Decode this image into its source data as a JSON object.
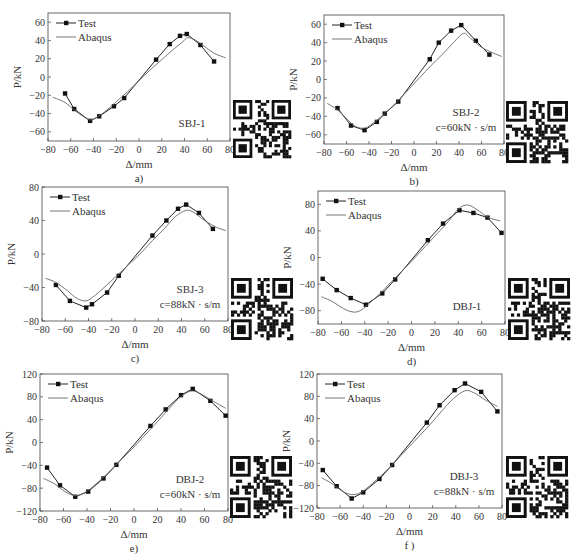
{
  "chart_data": [
    {
      "id": "a",
      "type": "line",
      "panel_label": "a)",
      "specimen": "SBJ-1",
      "damping": "",
      "xlabel": "Δ/mm",
      "ylabel": "P/kN",
      "xlim": [
        -80,
        80
      ],
      "ylim": [
        -70,
        70
      ],
      "xticks": [
        -80,
        -60,
        -40,
        -20,
        0,
        20,
        40,
        60,
        80
      ],
      "yticks": [
        -60,
        -40,
        -20,
        0,
        20,
        40,
        60
      ],
      "legend": [
        "Test",
        "Abaqus"
      ],
      "legend_position": "upper left",
      "grid": false,
      "frame": {
        "left": 48,
        "top": 13,
        "right": 230,
        "bottom": 141
      },
      "qr": {
        "x": 233,
        "y": 100,
        "size": 58
      },
      "series": [
        {
          "name": "Test",
          "marker": "square",
          "x": [
            -65,
            -57,
            -43,
            -35,
            -22,
            -13,
            15,
            27,
            36,
            42,
            54,
            66
          ],
          "y": [
            -18,
            -35,
            -48,
            -43,
            -32,
            -23,
            19,
            36,
            45,
            47,
            35,
            17
          ]
        },
        {
          "name": "Abaqus",
          "marker": "none",
          "x": [
            -76,
            -65,
            -55,
            -45,
            -40,
            -30,
            -20,
            -10,
            0,
            10,
            20,
            30,
            38,
            43,
            50,
            58,
            66,
            76
          ],
          "y": [
            -22,
            -28,
            -38,
            -46,
            -46,
            -38,
            -27,
            -16,
            -4,
            8,
            19,
            30,
            38,
            43,
            40,
            33,
            26,
            21
          ]
        }
      ]
    },
    {
      "id": "b",
      "type": "line",
      "panel_label": "b)",
      "specimen": "SBJ-2",
      "damping": "c=60kN · s/m",
      "xlabel": "Δ/mm",
      "ylabel": "P/kN",
      "xlim": [
        -80,
        80
      ],
      "ylim": [
        -70,
        70
      ],
      "xticks": [
        -80,
        -60,
        -40,
        -20,
        0,
        20,
        40,
        60,
        80
      ],
      "yticks": [
        -60,
        -40,
        -20,
        0,
        20,
        40,
        60
      ],
      "legend": [
        "Test",
        "Abaqus"
      ],
      "legend_position": "upper left",
      "grid": false,
      "frame": {
        "left": 324,
        "top": 15,
        "right": 504,
        "bottom": 144
      },
      "qr": {
        "x": 506,
        "y": 101,
        "size": 62
      },
      "series": [
        {
          "name": "Test",
          "marker": "square",
          "x": [
            -68,
            -56,
            -44,
            -33,
            -26,
            -14,
            14,
            22,
            33,
            42,
            55,
            67
          ],
          "y": [
            -31,
            -50,
            -55,
            -46,
            -37,
            -24,
            22,
            40,
            53,
            59,
            42,
            27
          ]
        },
        {
          "name": "Abaqus",
          "marker": "none",
          "x": [
            -77,
            -68,
            -58,
            -50,
            -42,
            -34,
            -25,
            -15,
            -5,
            5,
            15,
            25,
            35,
            44,
            50,
            60,
            70,
            78
          ],
          "y": [
            -26,
            -33,
            -45,
            -52,
            -52,
            -45,
            -36,
            -24,
            -11,
            2,
            15,
            27,
            40,
            50,
            45,
            35,
            29,
            25
          ]
        }
      ]
    },
    {
      "id": "c",
      "type": "line",
      "panel_label": "c)",
      "specimen": "SBJ-3",
      "damping": "c=88kN · s/m",
      "xlabel": "Δ/mm",
      "ylabel": "P/kN",
      "xlim": [
        -80,
        80
      ],
      "ylim": [
        -80,
        80
      ],
      "xticks": [
        -80,
        -60,
        -40,
        -20,
        0,
        20,
        40,
        60,
        80
      ],
      "yticks": [
        -80,
        -40,
        0,
        40,
        80
      ],
      "legend": [
        "Test",
        "Abaqus"
      ],
      "legend_position": "upper left",
      "grid": false,
      "frame": {
        "left": 42,
        "top": 187,
        "right": 228,
        "bottom": 321
      },
      "qr": {
        "x": 231,
        "y": 278,
        "size": 62
      },
      "series": [
        {
          "name": "Test",
          "marker": "square",
          "x": [
            -68,
            -56,
            -42,
            -37,
            -24,
            -14,
            15,
            27,
            37,
            44,
            55,
            67
          ],
          "y": [
            -37,
            -56,
            -64,
            -60,
            -46,
            -26,
            22,
            40,
            54,
            59,
            49,
            30
          ]
        },
        {
          "name": "Abaqus",
          "marker": "none",
          "x": [
            -77,
            -68,
            -58,
            -50,
            -42,
            -35,
            -25,
            -15,
            -5,
            5,
            15,
            25,
            35,
            44,
            50,
            60,
            70,
            78
          ],
          "y": [
            -29,
            -34,
            -44,
            -53,
            -56,
            -50,
            -38,
            -25,
            -12,
            1,
            16,
            30,
            45,
            52,
            50,
            40,
            32,
            28
          ]
        }
      ]
    },
    {
      "id": "d",
      "type": "line",
      "panel_label": "d)",
      "specimen": "DBJ-1",
      "damping": "",
      "xlabel": "Δ/mm",
      "ylabel": "P/kN",
      "xlim": [
        -80,
        80
      ],
      "ylim": [
        -100,
        100
      ],
      "xticks": [
        -80,
        -60,
        -40,
        -20,
        0,
        20,
        40,
        60,
        80
      ],
      "yticks": [
        -80,
        -40,
        0,
        40,
        80
      ],
      "legend": [
        "Test",
        "Abaqus"
      ],
      "legend_position": "upper left",
      "grid": false,
      "frame": {
        "left": 318,
        "top": 191,
        "right": 505,
        "bottom": 324
      },
      "qr": {
        "x": 508,
        "y": 278,
        "size": 62
      },
      "series": [
        {
          "name": "Test",
          "marker": "square",
          "x": [
            -76,
            -64,
            -52,
            -39,
            -25,
            -14,
            14,
            27,
            41,
            53,
            65,
            77
          ],
          "y": [
            -32,
            -49,
            -61,
            -71,
            -54,
            -33,
            26,
            51,
            71,
            67,
            60,
            37
          ]
        },
        {
          "name": "Abaqus",
          "marker": "none",
          "x": [
            -77,
            -68,
            -58,
            -50,
            -44,
            -38,
            -28,
            -18,
            -8,
            2,
            12,
            22,
            32,
            40,
            48,
            56,
            66,
            76
          ],
          "y": [
            -59,
            -66,
            -77,
            -82,
            -80,
            -72,
            -56,
            -38,
            -20,
            -2,
            17,
            36,
            55,
            73,
            79,
            72,
            60,
            55
          ]
        }
      ]
    },
    {
      "id": "e",
      "type": "line",
      "panel_label": "e)",
      "specimen": "DBJ-2",
      "damping": "c=60kN · s/m",
      "xlabel": "Δ/mm",
      "ylabel": "P/kN",
      "xlim": [
        -80,
        80
      ],
      "ylim": [
        -120,
        120
      ],
      "xticks": [
        -80,
        -60,
        -40,
        -20,
        0,
        20,
        40,
        60,
        80
      ],
      "yticks": [
        -120,
        -80,
        -40,
        0,
        40,
        80,
        120
      ],
      "legend": [
        "Test",
        "Abaqus"
      ],
      "legend_position": "upper left",
      "grid": false,
      "frame": {
        "left": 40,
        "top": 374,
        "right": 228,
        "bottom": 511
      },
      "qr": {
        "x": 230,
        "y": 456,
        "size": 62
      },
      "series": [
        {
          "name": "Test",
          "marker": "square",
          "x": [
            -74,
            -63,
            -50,
            -39,
            -26,
            -15,
            14,
            27,
            40,
            50,
            65,
            78
          ],
          "y": [
            -44,
            -75,
            -95,
            -86,
            -63,
            -39,
            29,
            58,
            83,
            94,
            73,
            47
          ]
        },
        {
          "name": "Abaqus",
          "marker": "none",
          "x": [
            -77,
            -68,
            -58,
            -50,
            -42,
            -32,
            -22,
            -12,
            -2,
            8,
            18,
            28,
            38,
            48,
            56,
            66,
            78
          ],
          "y": [
            -63,
            -72,
            -87,
            -93,
            -88,
            -72,
            -53,
            -32,
            -12,
            10,
            32,
            55,
            77,
            90,
            86,
            74,
            60
          ]
        }
      ]
    },
    {
      "id": "f",
      "type": "line",
      "panel_label": "f )",
      "specimen": "DBJ-3",
      "damping": "c=88kN · s/m",
      "xlabel": "Δ/mm",
      "ylabel": "P/kN",
      "xlim": [
        -80,
        80
      ],
      "ylim": [
        -120,
        120
      ],
      "xticks": [
        -80,
        -60,
        -40,
        -20,
        0,
        20,
        40,
        60,
        80
      ],
      "yticks": [
        -120,
        -80,
        -40,
        0,
        40,
        80,
        120
      ],
      "legend": [
        "Test",
        "Abaqus"
      ],
      "legend_position": "upper left",
      "grid": false,
      "frame": {
        "left": 317,
        "top": 374,
        "right": 502,
        "bottom": 508
      },
      "qr": {
        "x": 506,
        "y": 456,
        "size": 62
      },
      "series": [
        {
          "name": "Test",
          "marker": "square",
          "x": [
            -75,
            -63,
            -50,
            -40,
            -26,
            -15,
            15,
            26,
            39,
            48,
            62,
            76
          ],
          "y": [
            -52,
            -81,
            -103,
            -92,
            -68,
            -43,
            33,
            64,
            91,
            103,
            88,
            53
          ]
        },
        {
          "name": "Abaqus",
          "marker": "none",
          "x": [
            -76,
            -68,
            -58,
            -50,
            -42,
            -32,
            -22,
            -12,
            -2,
            8,
            18,
            28,
            38,
            48,
            56,
            66,
            76
          ],
          "y": [
            -66,
            -75,
            -90,
            -96,
            -92,
            -76,
            -57,
            -36,
            -14,
            8,
            30,
            54,
            76,
            90,
            86,
            73,
            62
          ]
        }
      ]
    }
  ]
}
